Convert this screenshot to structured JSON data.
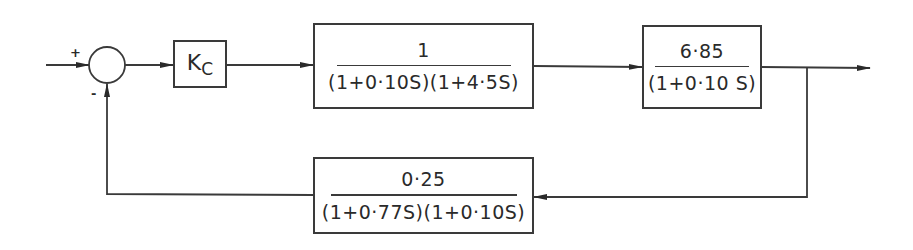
{
  "diagram": {
    "type": "closed-loop control block diagram",
    "summing_junction": {
      "plus_sign": "+",
      "minus_sign": "-"
    },
    "controller": {
      "label_main": "K",
      "label_sub": "C"
    },
    "forward_block_1": {
      "numerator": "1",
      "denominator": "(1+0·10S)(1+4·5S)"
    },
    "forward_block_2": {
      "numerator": "6·85",
      "denominator": "(1+0·10 S)"
    },
    "feedback_block": {
      "numerator": "0·25",
      "denominator": "(1+0·77S)(1+0·10S)"
    },
    "line_color": "#3a3a3a"
  }
}
